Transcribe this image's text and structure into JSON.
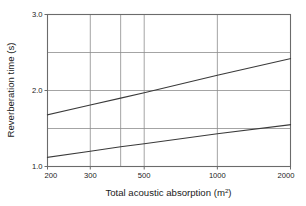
{
  "chart_data": {
    "type": "line",
    "title": "",
    "xlabel": "Total acoustic absorption (m²)",
    "xlabel_text": "Total acoustic absorption (m",
    "xlabel_sup": "2",
    "xlabel_tail": ")",
    "ylabel": "Reverberation time (s)",
    "xscale": "log",
    "yscale": "linear",
    "xlim": [
      200,
      2000
    ],
    "ylim": [
      1.0,
      3.0
    ],
    "grid": true,
    "legend": "none",
    "x_ticks": [
      {
        "value": 200,
        "label": "200",
        "labeled": true
      },
      {
        "value": 300,
        "label": "300",
        "labeled": true
      },
      {
        "value": 400,
        "label": "",
        "labeled": false
      },
      {
        "value": 500,
        "label": "500",
        "labeled": true
      },
      {
        "value": 1000,
        "label": "1000",
        "labeled": true
      },
      {
        "value": 2000,
        "label": "2000",
        "labeled": true
      }
    ],
    "y_ticks": [
      {
        "value": 1.0,
        "label": "1.0",
        "labeled": true
      },
      {
        "value": 1.5,
        "label": "",
        "labeled": false
      },
      {
        "value": 2.0,
        "label": "2.0",
        "labeled": true
      },
      {
        "value": 2.5,
        "label": "",
        "labeled": false
      },
      {
        "value": 3.0,
        "label": "3.0",
        "labeled": true
      }
    ],
    "series": [
      {
        "name": "upper-limit",
        "x": [
          200,
          300,
          400,
          500,
          1000,
          2000
        ],
        "values": [
          1.68,
          1.81,
          1.9,
          1.97,
          2.2,
          2.42
        ]
      },
      {
        "name": "lower-limit",
        "x": [
          200,
          300,
          400,
          500,
          1000,
          2000
        ],
        "values": [
          1.12,
          1.2,
          1.26,
          1.3,
          1.43,
          1.55
        ]
      }
    ],
    "colors": {
      "line": "#3a3a3a",
      "grid": "#8d8d8d",
      "axis": "#6b6b6b",
      "text": "#1a1a1a",
      "background": "#ffffff"
    }
  }
}
